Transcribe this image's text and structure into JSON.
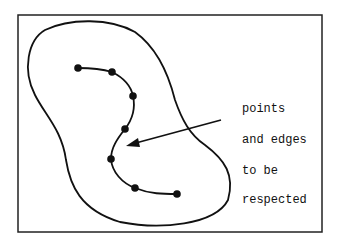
{
  "diagram": {
    "labels": [
      "points",
      "and edges",
      "to be",
      "respected"
    ],
    "points": [
      [
        78,
        68
      ],
      [
        112,
        72
      ],
      [
        133,
        96
      ],
      [
        125,
        129
      ],
      [
        111,
        159
      ],
      [
        135,
        188
      ],
      [
        177,
        194
      ]
    ],
    "colors": {
      "stroke": "#111111",
      "background": "#ffffff"
    }
  }
}
